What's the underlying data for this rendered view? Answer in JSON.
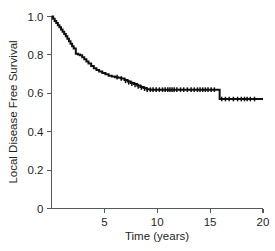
{
  "chart_data": {
    "type": "line",
    "title": "",
    "subtitle": "",
    "xlabel": "Time (years)",
    "ylabel": "Local Disease Free Survival",
    "xlim": [
      0,
      20
    ],
    "ylim": [
      0,
      1.0
    ],
    "grid": false,
    "legend": "none",
    "xticks": [
      0,
      5,
      10,
      15,
      20
    ],
    "xticklabels": [
      "0",
      "5",
      "10",
      "15",
      "20"
    ],
    "yticks": [
      0,
      0.2,
      0.4,
      0.6,
      0.8,
      1.0
    ],
    "yticklabels": [
      "0",
      "0.2",
      "0.4",
      "0.6",
      "0.8",
      "1.0"
    ],
    "series": [
      {
        "name": "Local Disease Free Survival",
        "style": "kaplan-meier-step",
        "color": "#101010",
        "x": [
          0.0,
          0.15,
          0.3,
          0.45,
          0.6,
          0.75,
          0.9,
          1.05,
          1.2,
          1.35,
          1.5,
          1.65,
          1.8,
          1.95,
          2.1,
          2.3,
          2.5,
          2.7,
          2.9,
          3.1,
          3.3,
          3.5,
          3.75,
          4.0,
          4.25,
          4.5,
          4.8,
          5.1,
          5.4,
          5.7,
          6.0,
          6.3,
          6.6,
          6.9,
          7.2,
          7.5,
          7.8,
          8.1,
          8.4,
          8.7,
          9.0,
          9.3,
          15.75,
          15.9,
          20.0
        ],
        "y": [
          1.0,
          0.988,
          0.977,
          0.966,
          0.955,
          0.944,
          0.932,
          0.921,
          0.909,
          0.897,
          0.884,
          0.871,
          0.858,
          0.845,
          0.833,
          0.806,
          0.802,
          0.798,
          0.788,
          0.777,
          0.766,
          0.755,
          0.742,
          0.731,
          0.722,
          0.713,
          0.706,
          0.699,
          0.692,
          0.688,
          0.684,
          0.681,
          0.677,
          0.669,
          0.661,
          0.654,
          0.648,
          0.641,
          0.633,
          0.627,
          0.621,
          0.619,
          0.619,
          0.57,
          0.57
        ]
      }
    ],
    "censored_points": {
      "description": "Censoring tick marks along the curve",
      "x": [
        6.2,
        6.6,
        7.0,
        7.3,
        7.6,
        7.9,
        8.2,
        8.5,
        8.8,
        9.05,
        9.35,
        9.6,
        9.9,
        10.2,
        10.5,
        10.75,
        11.0,
        11.2,
        11.4,
        11.6,
        11.85,
        12.2,
        12.5,
        12.85,
        13.2,
        13.5,
        13.8,
        14.05,
        14.3,
        14.55,
        14.8,
        15.1,
        15.4,
        16.1,
        16.45,
        16.8,
        17.2,
        17.6,
        17.95,
        18.25,
        18.5,
        18.8,
        19.2
      ],
      "y": [
        0.684,
        0.677,
        0.665,
        0.657,
        0.65,
        0.644,
        0.636,
        0.63,
        0.624,
        0.619,
        0.619,
        0.619,
        0.619,
        0.619,
        0.619,
        0.619,
        0.619,
        0.619,
        0.619,
        0.619,
        0.619,
        0.619,
        0.619,
        0.619,
        0.619,
        0.619,
        0.619,
        0.619,
        0.619,
        0.619,
        0.619,
        0.619,
        0.619,
        0.57,
        0.57,
        0.57,
        0.57,
        0.57,
        0.57,
        0.57,
        0.57,
        0.57,
        0.57
      ]
    },
    "annotations": [],
    "notes": {
      "start_value": "1.0",
      "plateau_value_1": "0.62",
      "plateau_value_2": "0.57",
      "final_drop_time": "15.8"
    }
  },
  "axes": {
    "x_title": "Time (years)",
    "y_title": "Local Disease Free Survival",
    "x_tick_labels": [
      "5",
      "10",
      "15",
      "20"
    ],
    "y_tick_labels": [
      "1.0",
      "0.8",
      "0.6",
      "0.4",
      "0.2",
      "0"
    ]
  },
  "colors": {
    "curve": "#101010",
    "axis": "#555a5e",
    "background": "#ffffff",
    "text": "#1f1f1f"
  }
}
